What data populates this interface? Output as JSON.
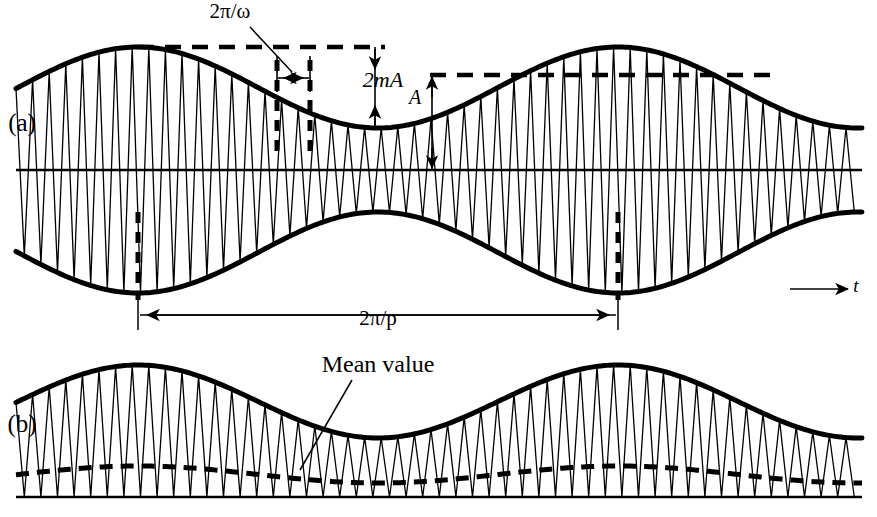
{
  "figure": {
    "title_present": false,
    "width": 877,
    "height": 517,
    "background": "#ffffff",
    "ink_color": "#000000"
  },
  "panels": [
    {
      "id": "a",
      "label": "(a)",
      "label_x": 22,
      "label_y": 131,
      "description": "Amplitude modulated carrier with upper and lower envelopes about a zero axis",
      "axis_label": "t",
      "axis_label_x": 856,
      "axis_label_y": 292
    },
    {
      "id": "b",
      "label": "(b)",
      "label_x": 22,
      "label_y": 432,
      "description": "Rectified amplitude modulated carrier with dashed mean value curve",
      "annotation": "Mean value"
    }
  ],
  "annotations": [
    {
      "name": "carrier-period-label",
      "text": "2π/ω",
      "x": 230,
      "y": 18,
      "anchor": "middle",
      "italic_part": "ω"
    },
    {
      "name": "modulation-depth-label",
      "text": "2mA",
      "x": 383,
      "y": 87,
      "anchor": "middle"
    },
    {
      "name": "amplitude-label",
      "text": "A",
      "x": 415,
      "y": 104,
      "anchor": "middle"
    },
    {
      "name": "modulation-period-label",
      "text": "2π/p",
      "x": 378,
      "y": 325,
      "anchor": "middle"
    },
    {
      "name": "mean-value-label",
      "text": "Mean value",
      "x": 378,
      "y": 372,
      "anchor": "middle"
    },
    {
      "name": "time-axis-label",
      "text": "t",
      "x": 856,
      "y": 292,
      "anchor": "middle"
    }
  ],
  "chart_data": {
    "type": "line",
    "title": "",
    "xlabel": "t",
    "ylabel": "",
    "grid": false,
    "legend": false,
    "signal_model": {
      "expression": "y(t) = A (1 + m cos(p t)) cos(ω t)",
      "carrier_symbol": "ω",
      "modulation_symbol": "p",
      "depth_symbol": "m",
      "amplitude_symbol": "A"
    },
    "panel_a": {
      "x_start": 16,
      "x_end": 862,
      "zero_axis_y": 170,
      "carrier_period_px": 16.6,
      "carrier_phase_px": 5,
      "envelope_period_px": 480,
      "envelope_peak_x_first": 138,
      "envelope_peak_y": 47,
      "envelope_trough_y": 128,
      "envelope_mid_y": 87.5,
      "upper_envelope_amp_px": 40.5,
      "lower_mirror": true,
      "upper_dashed_level_y": 47,
      "upper_dashed_x0": 138,
      "upper_dashed_x1": 385,
      "second_dashed_level_y": 75,
      "second_dashed_x0": 430,
      "second_dashed_x1": 772,
      "depth_arrow_x": 375,
      "depth_arrow_y_top": 47,
      "depth_arrow_y_bottom": 128,
      "amplitude_arrow_x": 432,
      "amplitude_arrow_y_top": 75,
      "amplitude_arrow_y_bottom": 170,
      "period_tick_x0": 277,
      "period_tick_x1": 310,
      "period_tick_y_top": 56,
      "period_tick_y_bottom": 92,
      "period_arrow_y": 78,
      "leader_from_x": 250,
      "leader_from_y": 27,
      "leader_to_x": 292,
      "leader_to_y": 72,
      "bold_dash_markers_x": [
        277,
        310,
        138,
        618
      ],
      "bold_dash_upper_y0": 60,
      "bold_dash_upper_y1": 155,
      "bold_dash_lower_y0": 212,
      "bold_dash_lower_y1": 300,
      "mod_period_arrow_y": 315,
      "mod_period_x0": 138,
      "mod_period_x1": 618,
      "mod_period_tick_top": 295,
      "mod_period_tick_bottom": 330,
      "time_axis_x0": 790,
      "time_axis_x1": 848,
      "time_axis_y": 289
    },
    "panel_b": {
      "x_start": 16,
      "x_end": 862,
      "baseline_y": 497,
      "carrier_period_px": 16.6,
      "carrier_phase_px": 5,
      "envelope_period_px": 480,
      "envelope_peak_x_first": 138,
      "envelope_peak_y": 365,
      "envelope_trough_y": 438,
      "envelope_mid_y": 401.5,
      "mean_peak_y": 466,
      "mean_trough_y": 483,
      "mean_dash_pattern": "13,8",
      "mean_leader_x0": 352,
      "mean_leader_y0": 380,
      "mean_leader_x1": 300,
      "mean_leader_y1": 470
    }
  },
  "stroke_widths": {
    "envelope": 5,
    "axis": 2.4,
    "carrier": 1.3,
    "dashed_level": 4.5,
    "mean_dashed": 5,
    "arrow": 1.6,
    "bold_marker": 5
  }
}
